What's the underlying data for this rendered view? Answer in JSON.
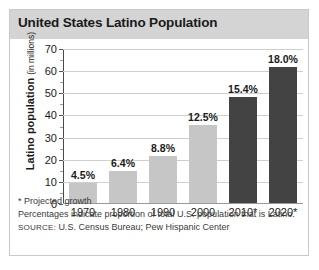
{
  "chart_data": {
    "type": "bar",
    "title": "United States Latino Population",
    "xlabel": "",
    "ylabel": "Latino population",
    "ylabel_unit": "(in millions)",
    "ylim": [
      0,
      70
    ],
    "ytick_step": 10,
    "grid": true,
    "legend": "none",
    "categories": [
      "1970",
      "1980",
      "1990",
      "2000",
      "2010*",
      "2020*"
    ],
    "values": [
      9.1,
      14.6,
      21.1,
      35.3,
      47.8,
      61.4
    ],
    "data_labels": [
      "4.5%",
      "6.4%",
      "8.8%",
      "12.5%",
      "15.4%",
      "18.0%"
    ],
    "ytick_labels": [
      "0",
      "10",
      "20",
      "30",
      "40",
      "50",
      "60",
      "70"
    ],
    "bar_colors": [
      "#c6c6c6",
      "#c6c6c6",
      "#c6c6c6",
      "#c6c6c6",
      "#434343",
      "#434343"
    ],
    "series": [
      {
        "name": "Latino population (in millions)",
        "values": [
          9.1,
          14.6,
          21.1,
          35.3,
          47.8,
          61.4
        ]
      },
      {
        "name": "Proportion of total U.S. population (%)",
        "values": [
          4.5,
          6.4,
          8.8,
          12.5,
          15.4,
          18.0
        ]
      }
    ],
    "annotations": [
      "* Projected growth",
      "Percentages indicate proportion of total U.S. population that is Latino."
    ]
  },
  "header": {
    "title": "United States Latino Population"
  },
  "footnotes": {
    "projected_note": "* Projected growth",
    "percent_note": "Percentages indicate proportion of total U.S. population that is Latino.",
    "source_label": "SOURCE:",
    "source_text": "U.S. Census Bureau; Pew Hispanic Center"
  },
  "colors": {
    "header_band": "#d4d4d4",
    "bar_light": "#c6c6c6",
    "bar_dark": "#434343",
    "border": "#c9c9c9",
    "gridline": "#cfcfcf"
  }
}
